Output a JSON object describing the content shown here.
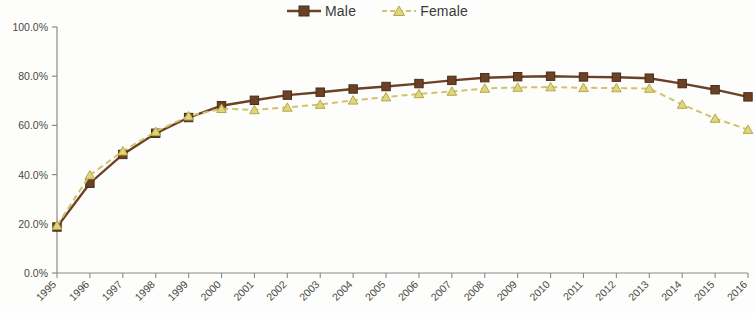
{
  "legend": {
    "items": [
      {
        "label": "Male",
        "color": "#6B4226",
        "marker": "square",
        "dash": "solid"
      },
      {
        "label": "Female",
        "color": "#CFC46B",
        "marker": "triangle",
        "dash": "dashed"
      }
    ]
  },
  "axes": {
    "y_ticks": [
      "0.0%",
      "20.0%",
      "40.0%",
      "60.0%",
      "80.0%",
      "100.0%"
    ],
    "x_ticks": [
      "1995",
      "1996",
      "1997",
      "1998",
      "1999",
      "2000",
      "2001",
      "2002",
      "2003",
      "2004",
      "2005",
      "2006",
      "2007",
      "2008",
      "2009",
      "2010",
      "2011",
      "2012",
      "2013",
      "2014",
      "2015",
      "2016"
    ]
  },
  "chart_data": {
    "type": "line",
    "title": "",
    "xlabel": "",
    "ylabel": "",
    "ylim": [
      0,
      100
    ],
    "grid": false,
    "legend_position": "top-center",
    "categories": [
      "1995",
      "1996",
      "1997",
      "1998",
      "1999",
      "2000",
      "2001",
      "2002",
      "2003",
      "2004",
      "2005",
      "2006",
      "2007",
      "2008",
      "2009",
      "2010",
      "2011",
      "2012",
      "2013",
      "2014",
      "2015",
      "2016"
    ],
    "series": [
      {
        "name": "Male",
        "color": "#6B4226",
        "marker": "square",
        "dash": "solid",
        "values": [
          18.7,
          36.5,
          48.2,
          56.8,
          63.2,
          68.0,
          70.2,
          72.3,
          73.5,
          74.8,
          75.8,
          77.0,
          78.3,
          79.4,
          79.8,
          80.0,
          79.7,
          79.6,
          79.2,
          77.0,
          74.5,
          71.6
        ]
      },
      {
        "name": "Female",
        "color": "#CFC46B",
        "marker": "triangle",
        "dash": "dashed",
        "values": [
          19.3,
          39.8,
          49.5,
          57.5,
          63.8,
          66.8,
          66.3,
          67.3,
          68.5,
          70.2,
          71.5,
          72.8,
          73.8,
          75.0,
          75.4,
          75.6,
          75.3,
          75.2,
          75.0,
          68.5,
          62.8,
          58.3
        ]
      }
    ]
  }
}
